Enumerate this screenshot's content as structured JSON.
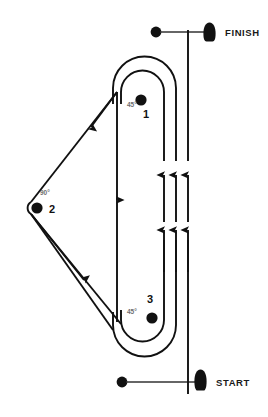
{
  "diagram": {
    "background_color": "#ffffff",
    "stroke_color": "#111111",
    "angle_label_color": "#6e6e6e",
    "width": 268,
    "height": 417
  },
  "gates": {
    "finish": {
      "label": "FINISH",
      "marker_icon": "pylon-cone-icon",
      "dot_icon": "gate-dot-icon"
    },
    "start": {
      "label": "START",
      "marker_icon": "pylon-cone-icon",
      "dot_icon": "gate-dot-icon"
    }
  },
  "pylons": [
    {
      "number": "1",
      "angle": "45°",
      "marker_icon": "pylon-dot-icon"
    },
    {
      "number": "2",
      "angle": "90°",
      "marker_icon": "pylon-dot-icon"
    },
    {
      "number": "3",
      "angle": "45°",
      "marker_icon": "pylon-dot-icon"
    }
  ],
  "path_arrows": {
    "upper_straight_count": "3",
    "lower_straight_count": "3",
    "direction": "counter-clockwise"
  }
}
